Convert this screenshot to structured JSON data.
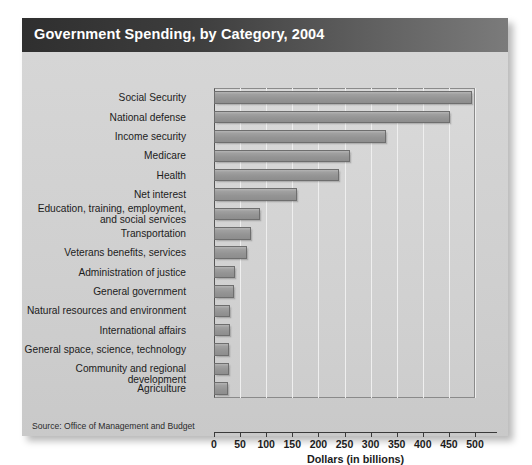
{
  "card": {
    "title": "Government Spending, by Category, 2004",
    "source": "Source: Office of Management and Budget"
  },
  "colors": {
    "header_dark": "#2f2f2f",
    "header_light": "#7b7b7b",
    "card_background": "#d2d2d2",
    "plot_background": "#d4d4d4",
    "bar_fill": "#9a9a9a",
    "bar_border": "#6e6e6e",
    "gridline": "#efefef",
    "axis": "#3a3a3a",
    "text": "#1c1c1c",
    "title_text": "#ffffff"
  },
  "chart_data": {
    "type": "bar",
    "orientation": "horizontal",
    "title": "Government Spending, by Category, 2004",
    "xlabel": "Dollars (in billions)",
    "ylabel": "",
    "xlim": [
      0,
      500
    ],
    "xticks": [
      0,
      50,
      100,
      150,
      200,
      250,
      300,
      350,
      400,
      450,
      500
    ],
    "grid": true,
    "grid_axis": "x",
    "legend": false,
    "source": "Source: Office of Management and Budget",
    "categories": [
      "Social Security",
      "National defense",
      "Income security",
      "Medicare",
      "Health",
      "Net interest",
      "Education, training, employment,\nand social services",
      "Transportation",
      "Veterans benefits, services",
      "Administration of justice",
      "General government",
      "Natural resources and environment",
      "International affairs",
      "General space,  science, technology",
      "Community and regional development",
      "Agriculture"
    ],
    "values": [
      495,
      453,
      330,
      260,
      240,
      159,
      88,
      70,
      64,
      40,
      38,
      31,
      30,
      29,
      28,
      27
    ],
    "units": "billions of dollars"
  },
  "axis_labels": {
    "t0": "0",
    "t50": "50",
    "t100": "100",
    "t150": "150",
    "t200": "200",
    "t250": "250",
    "t300": "300",
    "t350": "350",
    "t400": "400",
    "t450": "450",
    "t500": "500"
  }
}
